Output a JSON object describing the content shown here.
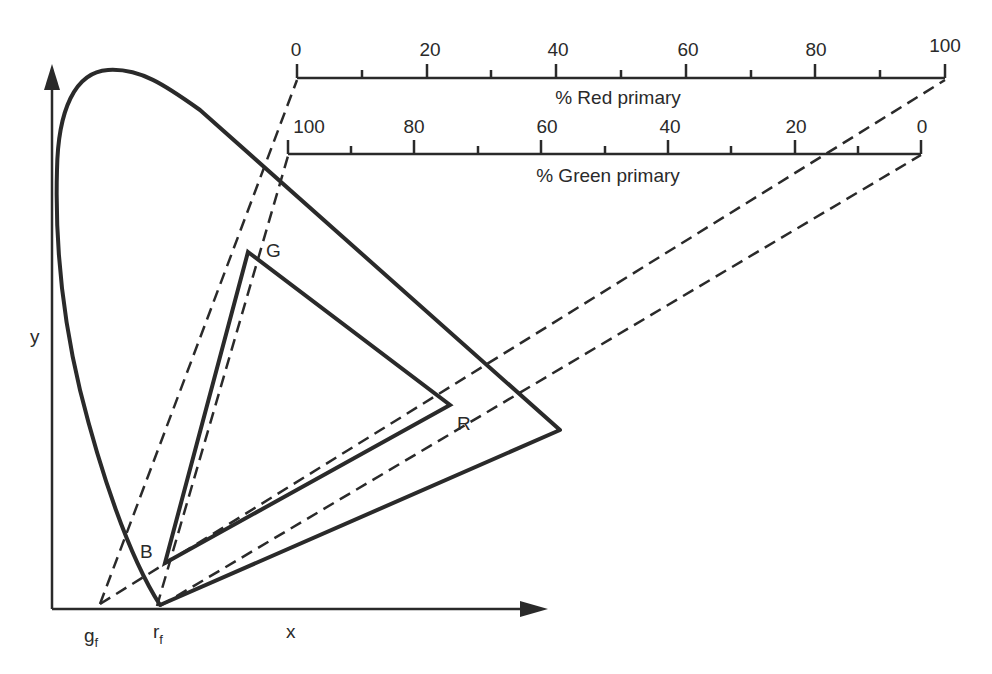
{
  "diagram": {
    "type": "chromaticity-diagram",
    "axes": {
      "x_label": "x",
      "y_label": "y"
    },
    "vertices": {
      "G": "G",
      "R": "R",
      "B": "B"
    },
    "axis_points": {
      "g_f": "g",
      "g_f_sub": "f",
      "r_f": "r",
      "r_f_sub": "f"
    },
    "red_scale": {
      "title": "% Red primary",
      "tick_labels": [
        "0",
        "20",
        "40",
        "60",
        "80",
        "100"
      ],
      "range": [
        0,
        100
      ],
      "minor_step": 10
    },
    "green_scale": {
      "title": "% Green primary",
      "tick_labels": [
        "100",
        "80",
        "60",
        "40",
        "20",
        "0"
      ],
      "range": [
        100,
        0
      ],
      "minor_step": 10
    },
    "colors": {
      "ink": "#2a2a2a",
      "background": "#ffffff"
    }
  }
}
